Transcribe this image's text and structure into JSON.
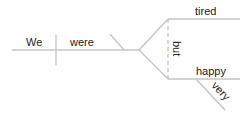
{
  "diagram": {
    "type": "sentence-diagram",
    "line_color": "#c4c4c4",
    "text_color": "#222222",
    "subject": "We",
    "verb": "were",
    "conjunction": "but",
    "complements": [
      "tired",
      "happy"
    ],
    "modifier": {
      "word": "very",
      "modifies": "happy"
    }
  }
}
